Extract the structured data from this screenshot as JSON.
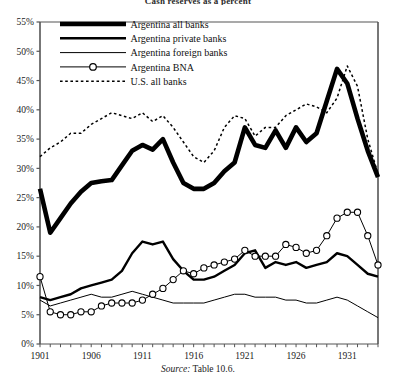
{
  "figure": {
    "title": "Cash reserves as a percent",
    "source_label": "Source:",
    "source_text": "Table 10.6."
  },
  "chart_data": {
    "type": "line",
    "title": "Cash reserves as a percent",
    "xlabel": "",
    "ylabel": "",
    "xlim": [
      1901,
      1934
    ],
    "ylim": [
      0,
      55
    ],
    "grid": false,
    "legend_position": "top-left",
    "y_ticks": [
      "0%",
      "5%",
      "10%",
      "15%",
      "20%",
      "25%",
      "30%",
      "35%",
      "40%",
      "45%",
      "50%",
      "55%"
    ],
    "y_tick_values": [
      0,
      5,
      10,
      15,
      20,
      25,
      30,
      35,
      40,
      45,
      50,
      55
    ],
    "x_ticks": [
      "1901",
      "1906",
      "1911",
      "1916",
      "1921",
      "1926",
      "1931"
    ],
    "x_tick_values": [
      1901,
      1906,
      1911,
      1916,
      1921,
      1926,
      1931
    ],
    "x": [
      1901,
      1902,
      1903,
      1904,
      1905,
      1906,
      1907,
      1908,
      1909,
      1910,
      1911,
      1912,
      1913,
      1914,
      1915,
      1916,
      1917,
      1918,
      1919,
      1920,
      1921,
      1922,
      1923,
      1924,
      1925,
      1926,
      1927,
      1928,
      1929,
      1930,
      1931,
      1932,
      1933,
      1934
    ],
    "series": [
      {
        "name": "Argentina all banks",
        "style": "very-thick-solid",
        "color": "#000000",
        "width": 4.6,
        "marker": "none",
        "values": [
          26.5,
          19.0,
          21.5,
          24.0,
          26.0,
          27.5,
          27.8,
          28.0,
          30.5,
          33.0,
          34.0,
          33.2,
          35.0,
          31.0,
          27.5,
          26.5,
          26.5,
          27.5,
          29.5,
          31.0,
          37.0,
          34.0,
          33.5,
          36.5,
          33.5,
          37.0,
          34.5,
          36.0,
          41.5,
          47.0,
          44.5,
          38.5,
          33.0,
          28.5
        ]
      },
      {
        "name": "Argentina private banks",
        "style": "thick-solid",
        "color": "#000000",
        "width": 2.4,
        "marker": "none",
        "values": [
          8.0,
          7.5,
          8.0,
          8.5,
          9.5,
          10.0,
          10.5,
          11.0,
          12.5,
          15.5,
          17.5,
          17.0,
          17.5,
          14.5,
          12.5,
          11.0,
          11.0,
          11.5,
          12.5,
          13.5,
          15.5,
          16.0,
          13.0,
          14.0,
          13.5,
          14.0,
          13.0,
          13.5,
          14.0,
          15.5,
          15.0,
          13.5,
          12.0,
          11.5
        ]
      },
      {
        "name": "Argentina foreign banks",
        "style": "thin-solid",
        "color": "#000000",
        "width": 1.0,
        "marker": "none",
        "values": [
          7.5,
          6.5,
          7.0,
          7.5,
          8.0,
          8.5,
          8.0,
          8.0,
          8.5,
          9.0,
          8.5,
          8.0,
          7.5,
          7.0,
          7.0,
          7.0,
          7.0,
          7.5,
          8.0,
          8.5,
          8.5,
          8.0,
          8.0,
          8.0,
          7.5,
          7.5,
          7.0,
          7.0,
          7.5,
          8.0,
          7.5,
          6.5,
          5.5,
          4.5
        ]
      },
      {
        "name": "Argentina BNA",
        "style": "thin-solid-markers",
        "color": "#000000",
        "width": 1.0,
        "marker": "circle",
        "values": [
          11.5,
          5.5,
          5.0,
          5.0,
          5.5,
          5.5,
          6.5,
          7.0,
          7.0,
          7.0,
          7.5,
          8.5,
          9.5,
          11.0,
          12.5,
          12.0,
          13.0,
          13.5,
          14.0,
          14.5,
          16.0,
          15.0,
          15.0,
          15.0,
          17.0,
          16.5,
          15.5,
          16.0,
          18.5,
          21.5,
          22.5,
          22.5,
          18.5,
          13.5
        ]
      },
      {
        "name": "U.S. all banks",
        "style": "dashed",
        "color": "#000000",
        "width": 1.5,
        "marker": "none",
        "values": [
          32.0,
          33.5,
          34.5,
          36.0,
          36.0,
          37.5,
          38.5,
          39.5,
          39.0,
          38.5,
          39.5,
          38.0,
          39.0,
          37.0,
          34.5,
          32.0,
          31.0,
          33.0,
          37.0,
          39.0,
          38.5,
          35.5,
          37.0,
          37.0,
          39.0,
          40.0,
          41.0,
          40.5,
          39.5,
          42.0,
          47.5,
          44.0,
          35.0,
          29.0
        ]
      }
    ]
  },
  "legend": {
    "items": [
      {
        "label": "Argentina all banks",
        "style": "very-thick-solid"
      },
      {
        "label": "Argentina private banks",
        "style": "thick-solid"
      },
      {
        "label": "Argentina foreign banks",
        "style": "thin-solid"
      },
      {
        "label": "Argentina BNA",
        "style": "thin-solid-markers"
      },
      {
        "label": "U.S. all banks",
        "style": "dashed"
      }
    ]
  }
}
